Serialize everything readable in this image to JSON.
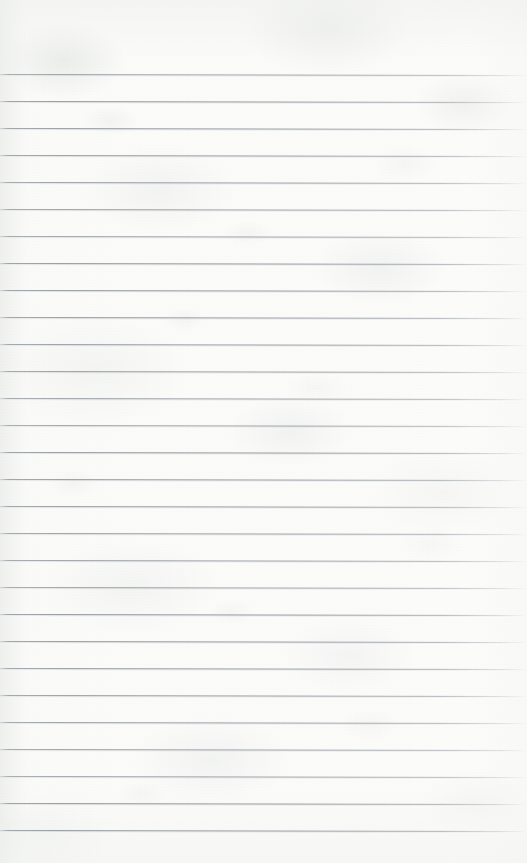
{
  "document": {
    "type": "lined-notebook-paper",
    "title": "Blank Ruled Notepad Sheet",
    "content_text": "",
    "written_content": "",
    "page_number": "",
    "width_px": 527,
    "height_px": 863
  },
  "paper": {
    "background_color": "#fbfbfa",
    "tint_description": "off-white with faint cool grey-green mottling",
    "edge_shade_color": "#ecedec",
    "texture": "subtle fibrous mottle and fine grain",
    "top_margin_px": 74,
    "left_edge_shading": true,
    "right_edge_shading": true
  },
  "ruling": {
    "line_color": "#8c9298",
    "line_secondary_color": "#bcc1c6",
    "line_thickness_px": 1,
    "line_spacing_px": 27,
    "first_line_y_px": 74,
    "last_line_y_px": 848,
    "line_count": 29,
    "line_start_x_px": 0,
    "line_end_x_px": 527,
    "right_fade": true,
    "tilt_degrees": 0.12,
    "margin_rule": false,
    "line_positions_y": [
      74,
      101,
      128,
      155,
      182,
      209,
      236,
      263,
      290,
      317,
      344,
      371,
      398,
      425,
      452,
      479,
      506,
      533,
      560,
      587,
      614,
      641,
      668,
      695,
      722,
      749,
      776,
      803,
      830
    ]
  }
}
